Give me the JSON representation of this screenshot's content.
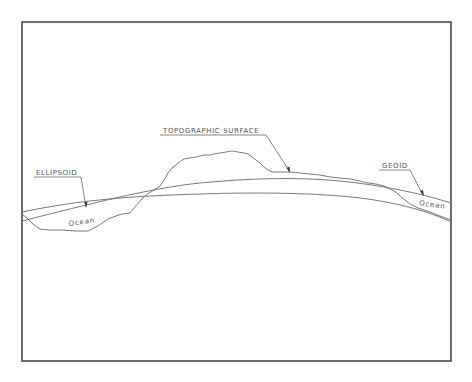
{
  "diagram": {
    "labels": {
      "ellipsoid": "ELLIPSOID",
      "topographic_surface": "TOPOGRAPHIC  SURFACE",
      "geoid": "GEOID",
      "ocean_left": "Ocean",
      "ocean_right": "Ocean"
    },
    "colors": {
      "frame": "#4a4a4a",
      "lines": "#6a6a6a",
      "text": "#555555",
      "background": "#ffffff"
    }
  }
}
